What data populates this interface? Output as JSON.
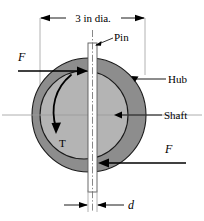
{
  "figure": {
    "type": "engineering-cross-section"
  },
  "dimensions": {
    "diameter_label": "3 in dia.",
    "pin_width_label": "d"
  },
  "labels": {
    "pin": "Pin",
    "hub": "Hub",
    "shaft": "Shaft",
    "torque": "T",
    "force_left": "F",
    "force_right": "F"
  },
  "colors": {
    "hub_fill": "#8d8d8d",
    "shaft_fill": "#b4b4b4",
    "pin_fill": "#ffffff",
    "outline": "#000000",
    "centerline": "#9a9a9a",
    "background": "#ffffff"
  },
  "geometry": {
    "center_x": 89,
    "center_y": 115,
    "hub_outer_radius": 57,
    "shaft_radius": 44,
    "pin_x": 88,
    "pin_width": 9,
    "pin_top_y": 43,
    "pin_bottom_y": 192
  }
}
